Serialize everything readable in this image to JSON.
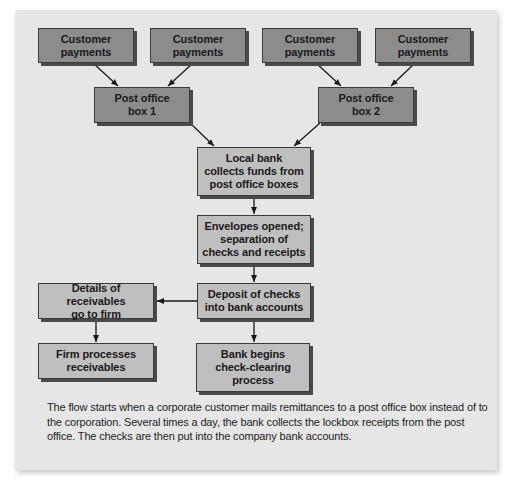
{
  "diagram": {
    "colors": {
      "panel_bg": "#e6e6e6",
      "source_box": "#8c8c8c",
      "process_box": "#bfbfbf",
      "arrow": "#1a1a1a"
    },
    "nodes": {
      "cp1": "Customer\npayments",
      "cp2": "Customer\npayments",
      "cp3": "Customer\npayments",
      "cp4": "Customer\npayments",
      "po1": "Post office\nbox 1",
      "po2": "Post office\nbox 2",
      "local_bank": "Local bank\ncollects funds from\npost office boxes",
      "envelopes": "Envelopes opened;\nseparation of\nchecks and receipts",
      "deposit": "Deposit of checks\ninto bank accounts",
      "details": "Details of receivables\ngo to firm",
      "firm_processes": "Firm processes\nreceivables",
      "bank_clearing": "Bank begins\ncheck-clearing\nprocess"
    },
    "edges": [
      [
        "cp1",
        "po1"
      ],
      [
        "cp2",
        "po1"
      ],
      [
        "cp3",
        "po2"
      ],
      [
        "cp4",
        "po2"
      ],
      [
        "po1",
        "local_bank"
      ],
      [
        "po2",
        "local_bank"
      ],
      [
        "local_bank",
        "envelopes"
      ],
      [
        "envelopes",
        "deposit"
      ],
      [
        "deposit",
        "details"
      ],
      [
        "deposit",
        "bank_clearing"
      ],
      [
        "details",
        "firm_processes"
      ]
    ],
    "caption": "The flow starts when a corporate customer mails remittances to a post office box instead of to the corporation. Several times a day, the bank collects the lockbox receipts from the post office. The checks are then put into the company bank accounts."
  }
}
